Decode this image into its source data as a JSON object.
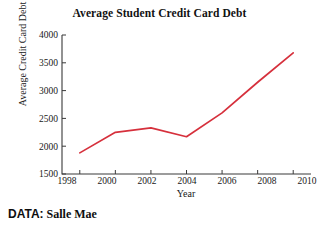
{
  "chart_data": {
    "type": "line",
    "title": "Average Student Credit Card Debt",
    "xlabel": "Year",
    "ylabel": "Average Credit Card Debt",
    "x": [
      1998,
      2000,
      2002,
      2004,
      2006,
      2008,
      2010
    ],
    "values": [
      1880,
      2250,
      2330,
      2170,
      2600,
      3150,
      3680
    ],
    "series": [
      {
        "name": "Average Credit Card Debt",
        "values": [
          1880,
          2250,
          2330,
          2170,
          2600,
          3150,
          3680
        ],
        "color": "#d6303c"
      }
    ],
    "xlim": [
      1997,
      2011
    ],
    "ylim": [
      1500,
      4000
    ],
    "xticks": [
      1998,
      2000,
      2002,
      2004,
      2006,
      2008,
      2010
    ],
    "xtick_labels": [
      "1998",
      "2000",
      "2002",
      "2004",
      "2006",
      "2008",
      "2010"
    ],
    "yticks": [
      1500,
      2000,
      2500,
      3000,
      3500,
      4000
    ],
    "ytick_labels": [
      "1500",
      "2000",
      "2500",
      "3000",
      "3500",
      "4000"
    ],
    "grid": false,
    "legend": "none",
    "ticks_direction": "in"
  },
  "source": {
    "prefix": "DATA:",
    "value": "Salle Mae"
  },
  "colors": {
    "line": "#d6303c",
    "axis": "#3a3a3a",
    "text": "#181818",
    "background": "#ffffff"
  }
}
